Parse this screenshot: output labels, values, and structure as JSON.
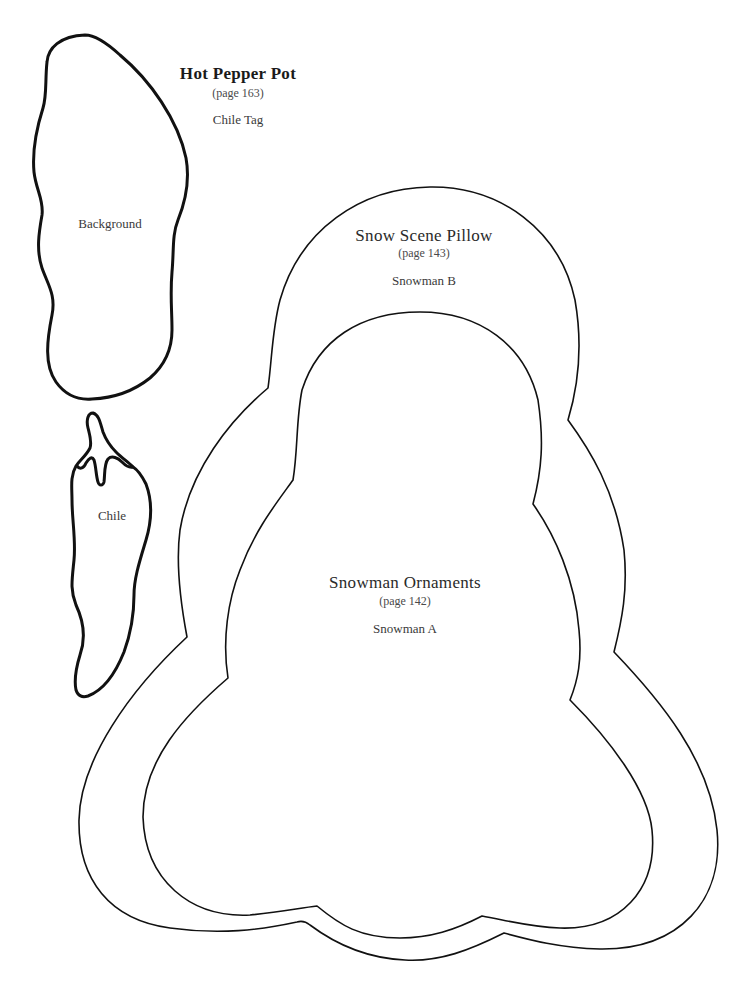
{
  "projects": [
    {
      "title": "Hot Pepper Pot",
      "page_ref": "(page 163)",
      "piece_label": "Chile Tag",
      "pieces": [
        {
          "name": "Background"
        },
        {
          "name": "Chile"
        }
      ]
    },
    {
      "title": "Snow Scene Pillow",
      "page_ref": "(page 143)",
      "piece_label": "Snowman B"
    },
    {
      "title": "Snowman Ornaments",
      "page_ref": "(page 142)",
      "piece_label": "Snowman A"
    }
  ],
  "colors": {
    "background": "#ffffff",
    "outline": "#111111",
    "text": "#3a3a3a"
  }
}
